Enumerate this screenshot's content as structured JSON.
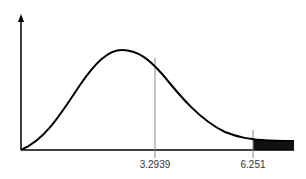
{
  "diagram": {
    "type": "distribution-curve",
    "markers": [
      {
        "label": "3.2939",
        "x_px": 155
      },
      {
        "label": "6.251",
        "x_px": 253
      }
    ],
    "shaded_region": "right tail beyond 6.251",
    "colors": {
      "curve": "#000000",
      "axis": "#000000",
      "marker_line": "#888888",
      "shade": "#111111"
    }
  }
}
